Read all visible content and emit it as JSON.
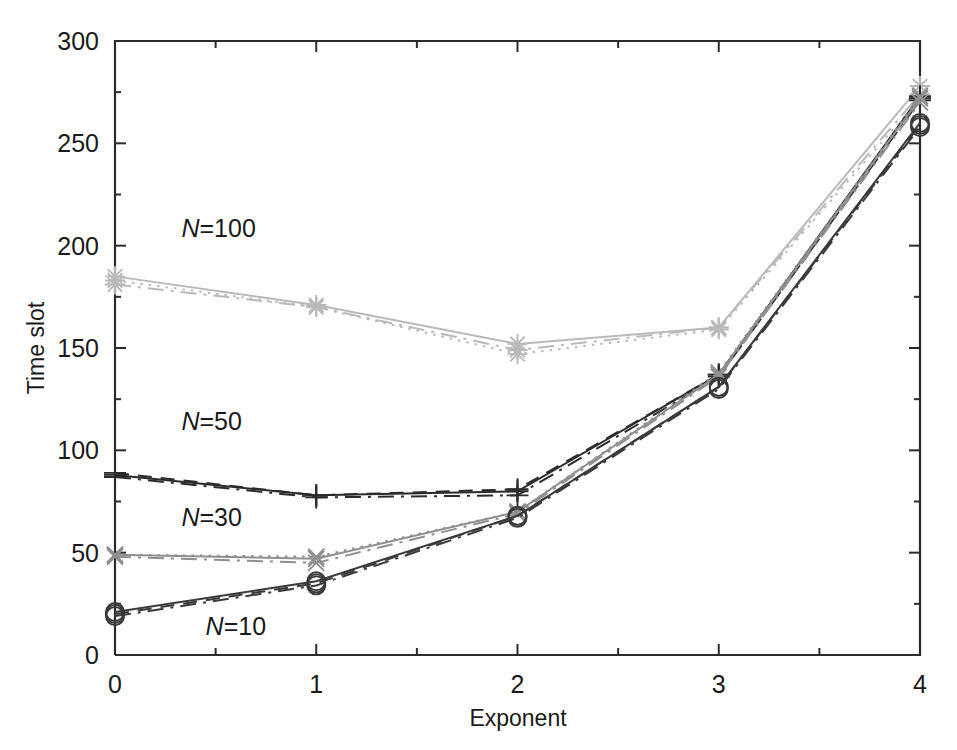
{
  "chart_data": {
    "type": "line",
    "title": "",
    "xlabel": "Exponent",
    "ylabel": "Time slot",
    "x": [
      0,
      1,
      2,
      3,
      4
    ],
    "xlim": [
      0,
      4
    ],
    "ylim": [
      0,
      300
    ],
    "xticks": [
      "0",
      "1",
      "2",
      "3",
      "4"
    ],
    "yticks": [
      "0",
      "50",
      "100",
      "150",
      "200",
      "250",
      "300"
    ],
    "grid": false,
    "legend_position": "inline-annotations",
    "annotations": [
      {
        "text_n": "N",
        "text_eq": "=",
        "text_val": "100",
        "x": 0.33,
        "y": 204
      },
      {
        "text_n": "N",
        "text_eq": "=",
        "text_val": "50",
        "x": 0.33,
        "y": 110
      },
      {
        "text_n": "N",
        "text_eq": "=",
        "text_val": "30",
        "x": 0.33,
        "y": 63
      },
      {
        "text_n": "N",
        "text_eq": "=",
        "text_val": "10",
        "x": 0.45,
        "y": 10
      }
    ],
    "groups": [
      {
        "name": "N=100",
        "marker": "star",
        "color": "#b9b9b9",
        "series": [
          {
            "name": "N=100 solid",
            "style": "solid",
            "values": [
              185,
              171,
              152,
              160,
              278
            ]
          },
          {
            "name": "N=100 dashdot",
            "style": "dashdot",
            "values": [
              181,
              170,
              149,
              160,
              274
            ]
          },
          {
            "name": "N=100 dotted",
            "style": "dotted",
            "values": [
              183,
              170,
              147,
              159,
              272
            ]
          }
        ]
      },
      {
        "name": "N=50",
        "marker": "plus",
        "color": "#2b2b2b",
        "series": [
          {
            "name": "N=50 solid",
            "style": "solid",
            "values": [
              88,
              78,
              80,
              137,
              273
            ]
          },
          {
            "name": "N=50 dashed",
            "style": "dashed",
            "values": [
              89,
              78,
              81,
              137,
              272
            ]
          },
          {
            "name": "N=50 dashdot",
            "style": "dashdot",
            "values": [
              87,
              77,
              78,
              136,
              271
            ]
          }
        ]
      },
      {
        "name": "N=30",
        "marker": "cross",
        "color": "#8f8f8f",
        "series": [
          {
            "name": "N=30 solid",
            "style": "solid",
            "values": [
              49,
              47,
              70,
              137,
              272
            ]
          },
          {
            "name": "N=30 dotted",
            "style": "dotted",
            "values": [
              49,
              48,
              70,
              138,
              273
            ]
          },
          {
            "name": "N=30 dashdot",
            "style": "dashdot",
            "values": [
              48,
              45,
              69,
              136,
              270
            ]
          }
        ]
      },
      {
        "name": "N=10",
        "marker": "circle",
        "color": "#3a3a3a",
        "series": [
          {
            "name": "N=10 solid",
            "style": "solid",
            "values": [
              21,
              36,
              68,
              131,
              260
            ]
          },
          {
            "name": "N=10 dashdot",
            "style": "dashdot",
            "values": [
              19,
              34,
              67,
              130,
              258
            ]
          },
          {
            "name": "N=10 dashed",
            "style": "dashed",
            "values": [
              20,
              35,
              68,
              131,
              259
            ]
          }
        ]
      }
    ]
  },
  "figure": {
    "background_color": "#ffffff",
    "axis_color": "#2b2b2b"
  }
}
